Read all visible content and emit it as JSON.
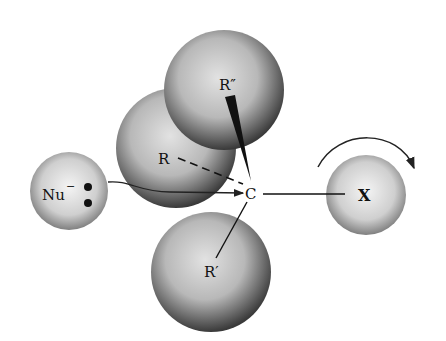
{
  "diagram": {
    "labels": {
      "nucleophile": "Nu",
      "nucleophile_charge": "−",
      "central_atom": "C",
      "leaving_group": "X",
      "substituent_r": "R",
      "substituent_r_prime": "R′",
      "substituent_r_double_prime": "R″"
    },
    "icons": {
      "lone-pair": "two filled dots",
      "attack-arrow": "curved arrow from Nu to C",
      "rotation-arrow": "curved clockwise arrow above X"
    }
  }
}
